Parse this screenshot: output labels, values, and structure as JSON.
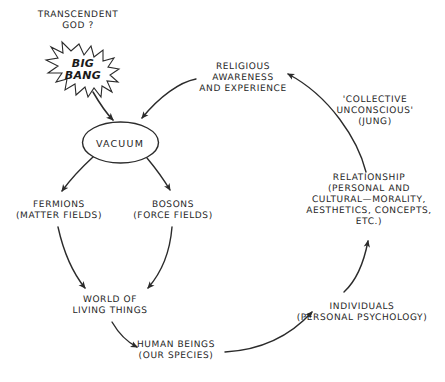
{
  "diagram": {
    "canvas": {
      "width": 445,
      "height": 382
    },
    "ink_color": "#2b2b2b",
    "background_color": "#ffffff",
    "nodes": {
      "transcendent_god": "TRANSCENDENT\nGOD ?",
      "big_bang": "BIG\nBANG",
      "vacuum": "VACUUM",
      "fermions": "FERMIONS\n(MATTER FIELDS)",
      "bosons": "BOSONS\n(FORCE FIELDS)",
      "world_of_living_things": "WORLD OF\nLIVING THINGS",
      "human_beings": "HUMAN BEINGS\n(OUR SPECIES)",
      "individuals": "INDIVIDUALS\n(PERSONAL PSYCHOLOGY)",
      "relationship": "RELATIONSHIP\n(PERSONAL AND\nCULTURAL—MORALITY,\nAESTHETICS, CONCEPTS,\nETC.)",
      "collective_unconscious": "'COLLECTIVE\nUNCONSCIOUS'\n(JUNG)",
      "religious_awareness": "RELIGIOUS\nAWARENESS\nAND EXPERIENCE"
    },
    "edges": [
      {
        "from": "big_bang",
        "to": "vacuum"
      },
      {
        "from": "religious_awareness",
        "to": "vacuum"
      },
      {
        "from": "vacuum",
        "to": "fermions"
      },
      {
        "from": "vacuum",
        "to": "bosons"
      },
      {
        "from": "fermions",
        "to": "world_of_living_things"
      },
      {
        "from": "bosons",
        "to": "world_of_living_things"
      },
      {
        "from": "world_of_living_things",
        "to": "human_beings"
      },
      {
        "from": "human_beings",
        "to": "individuals"
      },
      {
        "from": "individuals",
        "to": "relationship"
      },
      {
        "from": "relationship",
        "to": "religious_awareness"
      }
    ]
  }
}
